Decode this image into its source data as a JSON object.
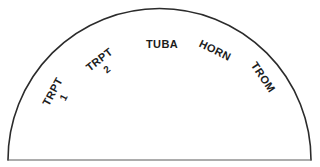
{
  "diagram": {
    "type": "band-seating-arc",
    "shape": "semicircle",
    "stroke_color": "#2b2b2b",
    "background_color": "#ffffff",
    "text_color": "#1c1c1c",
    "sections": [
      {
        "id": "trpt1",
        "label": "TRPT",
        "sublabel": "1",
        "rotation_deg": -62,
        "position": "arc-left-outer"
      },
      {
        "id": "trpt2",
        "label": "TRPT",
        "sublabel": "2",
        "rotation_deg": -38,
        "position": "arc-left-inner"
      },
      {
        "id": "tuba",
        "label": "TUBA",
        "sublabel": "",
        "rotation_deg": 0,
        "position": "arc-center"
      },
      {
        "id": "horn",
        "label": "HORN",
        "sublabel": "",
        "rotation_deg": 26,
        "position": "arc-right-inner"
      },
      {
        "id": "trom",
        "label": "TROM",
        "sublabel": "",
        "rotation_deg": 56,
        "position": "arc-right-outer"
      }
    ]
  }
}
